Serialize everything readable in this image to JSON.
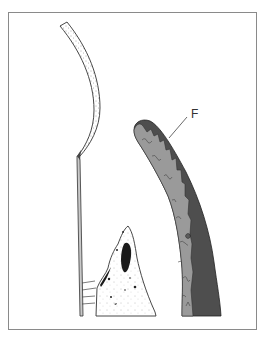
{
  "figure": {
    "labels": [
      {
        "id": "F",
        "text": "F"
      }
    ],
    "structures": [
      {
        "name": "stippled-curved-strip",
        "fill": "stippled"
      },
      {
        "name": "thin-rod"
      },
      {
        "name": "stippled-peak-with-dark-cavity"
      },
      {
        "name": "curved-tube-two-layer",
        "inner_color": "#9a9a9a",
        "outer_color": "#4e4e4e"
      }
    ],
    "colors": {
      "border": "#8a8a8a",
      "line": "#333333",
      "tube_light": "#9a9a9a",
      "tube_dark": "#4e4e4e",
      "cavity": "#1a1a1a"
    }
  }
}
